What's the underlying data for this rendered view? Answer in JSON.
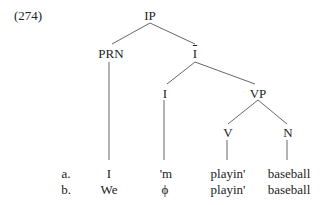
{
  "example_number": "(274)",
  "tree": {
    "nodes": {
      "ip": "IP",
      "prn": "PRN",
      "ibar": "I",
      "i": "I",
      "vp": "VP",
      "v": "V",
      "n": "N"
    },
    "ibar_has_overbar": true
  },
  "rows": [
    {
      "label": "a.",
      "prn": "I",
      "i": "'m",
      "v": "playin'",
      "n": "baseball"
    },
    {
      "label": "b.",
      "prn": "We",
      "i": "ϕ",
      "v": "playin'",
      "n": "baseball"
    }
  ]
}
